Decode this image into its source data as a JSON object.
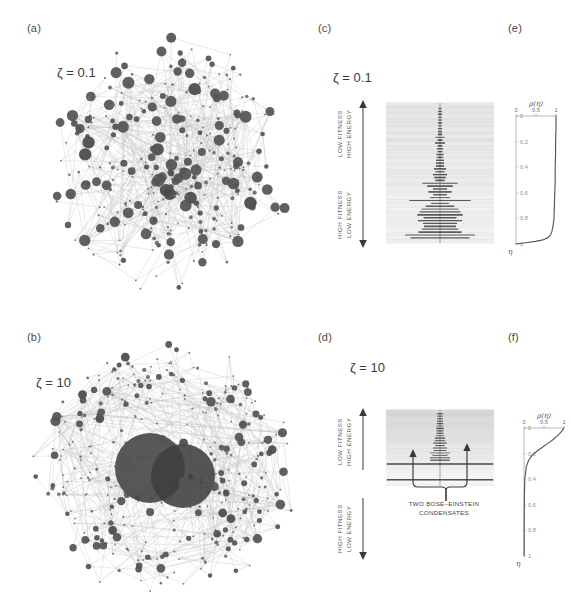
{
  "figure": {
    "background": "#ffffff",
    "ink": "#3a3a3a",
    "node_color": "#4a4a4a",
    "edge_color": "#b9b9b9",
    "level_color": "#8d8d8d"
  },
  "panels": [
    {
      "id": "a",
      "letter": "(a)",
      "type": "network",
      "parameter_label": "ζ = 0.1",
      "description": "fit-get-rich network with several moderate hubs"
    },
    {
      "id": "b",
      "letter": "(b)",
      "type": "network",
      "parameter_label": "ζ = 10",
      "description": "winner-takes-all network with two giant merged hubs"
    },
    {
      "id": "c",
      "letter": "(c)",
      "type": "energy-spectrum",
      "parameter_label": "ζ = 0.1",
      "axis_top_label": "LOW FITNESS\nHIGH ENERGY",
      "axis_top_line1": "LOW FITNESS",
      "axis_top_line2": "HIGH ENERGY",
      "axis_bottom_line1": "HIGH FITNESS",
      "axis_bottom_line2": "LOW ENERGY"
    },
    {
      "id": "d",
      "letter": "(d)",
      "type": "energy-spectrum",
      "parameter_label": "ζ = 10",
      "axis_top_line1": "LOW FITNESS",
      "axis_top_line2": "HIGH ENERGY",
      "axis_bottom_line1": "HIGH FITNESS",
      "axis_bottom_line2": "LOW ENERGY",
      "annotation_line1": "TWO BOSE–EINSTEIN",
      "annotation_line2": "CONDENSATES"
    },
    {
      "id": "e",
      "letter": "(e)",
      "type": "distribution"
    },
    {
      "id": "f",
      "letter": "(f)",
      "type": "distribution"
    }
  ],
  "chart_data": [
    {
      "panel": "e",
      "type": "line",
      "title": "ρ(η)",
      "xlabel": "ρ(η)",
      "ylabel": "η",
      "orientation": "vertical-eta-downward",
      "xlim": [
        0,
        1
      ],
      "ylim": [
        0,
        1
      ],
      "xticks": [
        0,
        0.5,
        1
      ],
      "xticklabels": [
        "0",
        "0.5",
        "1"
      ],
      "yticks": [
        0,
        0.2,
        0.4,
        0.6,
        0.8,
        1
      ],
      "yticklabels": [
        "0",
        "0.2",
        "0.4",
        "0.6",
        "0.8",
        "1"
      ],
      "grid": false,
      "legend": "none",
      "eta": [
        0.0,
        0.1,
        0.2,
        0.3,
        0.4,
        0.5,
        0.6,
        0.7,
        0.8,
        0.85,
        0.9,
        0.93,
        0.95,
        0.97,
        0.98,
        0.99,
        1.0
      ],
      "rho": [
        1.0,
        1.0,
        0.99,
        0.99,
        0.98,
        0.98,
        0.97,
        0.96,
        0.95,
        0.93,
        0.9,
        0.86,
        0.8,
        0.65,
        0.48,
        0.25,
        0.0
      ]
    },
    {
      "panel": "f",
      "type": "line",
      "title": "ρ(η)",
      "xlabel": "ρ(η)",
      "ylabel": "η",
      "orientation": "vertical-eta-downward",
      "xlim": [
        0,
        1
      ],
      "ylim": [
        0,
        1
      ],
      "xticks": [
        0,
        0.5,
        1
      ],
      "xticklabels": [
        "0",
        "0.5",
        "1"
      ],
      "yticks": [
        0,
        0.2,
        0.4,
        0.6,
        0.8,
        1
      ],
      "yticklabels": [
        "0",
        "0.2",
        "0.4",
        "0.6",
        "0.8",
        "1"
      ],
      "grid": false,
      "legend": "none",
      "eta": [
        0.0,
        0.03,
        0.06,
        0.09,
        0.12,
        0.15,
        0.18,
        0.21,
        0.25,
        0.3,
        0.4,
        0.5,
        0.6,
        0.7,
        0.8,
        0.9,
        1.0
      ],
      "rho": [
        1.0,
        0.93,
        0.84,
        0.73,
        0.6,
        0.46,
        0.33,
        0.21,
        0.12,
        0.06,
        0.02,
        0.012,
        0.008,
        0.006,
        0.005,
        0.004,
        0.003
      ]
    }
  ]
}
